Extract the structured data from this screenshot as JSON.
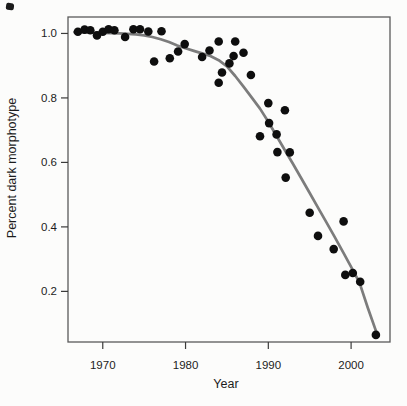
{
  "figure": {
    "background": "#fcfcfb",
    "frame_color": "#5a5a5a",
    "tick_color": "#3a3a3a",
    "text_color": "#1c1c1c"
  },
  "chart_data": {
    "type": "scatter",
    "title": "",
    "xlabel": "Year",
    "ylabel": "Percent dark morphotype",
    "legend": "none",
    "grid": false,
    "x_range": [
      1965.8,
      2004.7
    ],
    "y_range": [
      0.043,
      1.051
    ],
    "x_ticks": [
      {
        "label": "1970",
        "value": 1970
      },
      {
        "label": "1980",
        "value": 1980
      },
      {
        "label": "1990",
        "value": 1990
      },
      {
        "label": "2000",
        "value": 2000
      }
    ],
    "y_ticks": [
      {
        "label": "0.2",
        "value": 0.2
      },
      {
        "label": "0.4",
        "value": 0.4
      },
      {
        "label": "0.6",
        "value": 0.6
      },
      {
        "label": "0.8",
        "value": 0.8
      },
      {
        "label": "1.0",
        "value": 1.0
      }
    ],
    "point_color": "#0e0e0e",
    "point_radius": 4.3,
    "trend_color": "#7c7c7c",
    "trend_width": 2.7,
    "points": [
      [
        1967.0,
        1.005
      ],
      [
        1967.8,
        1.012
      ],
      [
        1968.5,
        1.01
      ],
      [
        1969.3,
        0.994
      ],
      [
        1970.0,
        1.005
      ],
      [
        1970.7,
        1.013
      ],
      [
        1971.4,
        1.01
      ],
      [
        1972.7,
        0.989
      ],
      [
        1973.7,
        1.013
      ],
      [
        1974.5,
        1.013
      ],
      [
        1975.5,
        1.006
      ],
      [
        1976.2,
        0.913
      ],
      [
        1977.1,
        1.007
      ],
      [
        1978.1,
        0.923
      ],
      [
        1979.1,
        0.944
      ],
      [
        1979.9,
        0.967
      ],
      [
        1982.0,
        0.927
      ],
      [
        1982.9,
        0.947
      ],
      [
        1984.0,
        0.975
      ],
      [
        1984.0,
        0.847
      ],
      [
        1984.4,
        0.879
      ],
      [
        1985.3,
        0.907
      ],
      [
        1985.8,
        0.93
      ],
      [
        1986.0,
        0.975
      ],
      [
        1987.0,
        0.94
      ],
      [
        1987.9,
        0.871
      ],
      [
        1989.0,
        0.681
      ],
      [
        1990.0,
        0.784
      ],
      [
        1990.1,
        0.722
      ],
      [
        1991.0,
        0.687
      ],
      [
        1991.1,
        0.632
      ],
      [
        1992.0,
        0.762
      ],
      [
        1992.1,
        0.553
      ],
      [
        1992.6,
        0.631
      ],
      [
        1995.0,
        0.444
      ],
      [
        1996.0,
        0.372
      ],
      [
        1997.9,
        0.331
      ],
      [
        1999.1,
        0.417
      ],
      [
        1999.3,
        0.251
      ],
      [
        2000.2,
        0.257
      ],
      [
        2001.1,
        0.23
      ],
      [
        2003.0,
        0.065
      ]
    ],
    "trend_line": [
      [
        1966.6,
        1.004
      ],
      [
        1968.0,
        1.003
      ],
      [
        1970.0,
        1.002
      ],
      [
        1972.0,
        1.0
      ],
      [
        1974.0,
        0.997
      ],
      [
        1975.0,
        0.994
      ],
      [
        1976.0,
        0.989
      ],
      [
        1977.0,
        0.982
      ],
      [
        1978.0,
        0.973
      ],
      [
        1979.0,
        0.963
      ],
      [
        1980.0,
        0.954
      ],
      [
        1981.0,
        0.946
      ],
      [
        1982.0,
        0.938
      ],
      [
        1983.0,
        0.93
      ],
      [
        1984.0,
        0.917
      ],
      [
        1985.0,
        0.898
      ],
      [
        1986.0,
        0.868
      ],
      [
        1987.0,
        0.835
      ],
      [
        1988.0,
        0.801
      ],
      [
        1989.0,
        0.767
      ],
      [
        1990.0,
        0.726
      ],
      [
        1991.0,
        0.682
      ],
      [
        1992.0,
        0.638
      ],
      [
        1993.0,
        0.594
      ],
      [
        1994.0,
        0.55
      ],
      [
        1995.0,
        0.505
      ],
      [
        1996.0,
        0.46
      ],
      [
        1997.0,
        0.415
      ],
      [
        1998.0,
        0.37
      ],
      [
        1999.0,
        0.323
      ],
      [
        2000.0,
        0.276
      ],
      [
        2001.0,
        0.228
      ],
      [
        2002.0,
        0.15
      ],
      [
        2003.2,
        0.063
      ]
    ]
  }
}
